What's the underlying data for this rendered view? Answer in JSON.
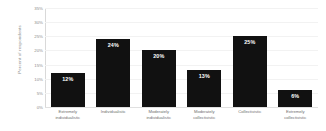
{
  "chart_data": {
    "type": "bar",
    "title": "",
    "xlabel": "",
    "ylabel": "Percent of respondents",
    "ylim": [
      0,
      35
    ],
    "grid": true,
    "legend": "none",
    "orientation": "vertical",
    "bar_color": "#111111",
    "value_label_color": "#ffffff",
    "gridline_color": "#f2f2f2",
    "axis_text_color": "#8c8c8c",
    "categories": [
      "Extremely individualistic",
      "Individualistic",
      "Moderately individualistic",
      "Moderately collectivistic",
      "Collectivistic",
      "Extremely collectivistic"
    ],
    "category_lines": [
      [
        "Extremely",
        "individualistic"
      ],
      [
        "Individualistic"
      ],
      [
        "Moderately",
        "individualistic"
      ],
      [
        "Moderately",
        "collectivistic"
      ],
      [
        "Collectivistic"
      ],
      [
        "Extremely",
        "collectivistic"
      ]
    ],
    "values": [
      12,
      24,
      20,
      13,
      25,
      6
    ],
    "value_labels": [
      "12%",
      "24%",
      "20%",
      "13%",
      "25%",
      "6%"
    ],
    "yticks": [
      0,
      5,
      10,
      15,
      20,
      25,
      30,
      35
    ],
    "ytick_labels": [
      "0%",
      "5%",
      "10%",
      "15%",
      "20%",
      "25%",
      "30%",
      "35%"
    ]
  }
}
